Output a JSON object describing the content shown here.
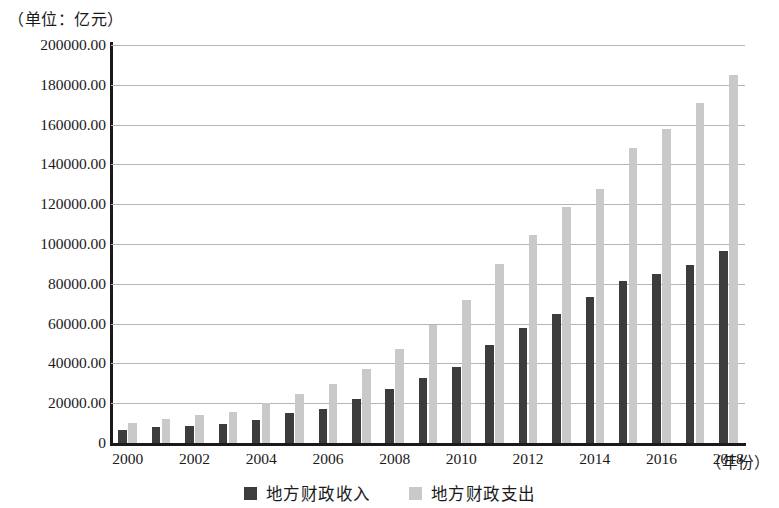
{
  "caption": {
    "unit_label": "（单位：亿元）",
    "x_axis_unit_label": "（年份）"
  },
  "legend": {
    "position": "bottom-center",
    "items": [
      {
        "label": "地方财政收入",
        "color": "#3c3c3c",
        "key": "revenue"
      },
      {
        "label": "地方财政支出",
        "color": "#c9c9c9",
        "key": "expenditure"
      }
    ]
  },
  "axes": {
    "y_ticks": [
      "200000.00",
      "180000.00",
      "160000.00",
      "140000.00",
      "120000.00",
      "100000.00",
      "80000.00",
      "60000.00",
      "40000.00",
      "20000.00",
      "0"
    ],
    "x_ticks": [
      "2000",
      "2002",
      "2004",
      "2006",
      "2008",
      "2010",
      "2012",
      "2014",
      "2016",
      "2018"
    ]
  },
  "chart_data": {
    "type": "bar",
    "title": "",
    "subtitle": "",
    "xlabel": "（年份）",
    "ylabel": "（单位：亿元）",
    "ylim": [
      0,
      200000
    ],
    "ytick_step": 20000,
    "grid": true,
    "legend_position": "bottom-center",
    "categories": [
      "2000",
      "2001",
      "2002",
      "2003",
      "2004",
      "2005",
      "2006",
      "2007",
      "2008",
      "2009",
      "2010",
      "2011",
      "2012",
      "2013",
      "2014",
      "2015",
      "2016",
      "2017",
      "2018"
    ],
    "series": [
      {
        "name": "地方财政收入",
        "color": "#3c3c3c",
        "values": [
          6400,
          7800,
          8500,
          9800,
          11800,
          14900,
          17000,
          22000,
          27000,
          32500,
          38000,
          49500,
          58000,
          65000,
          73500,
          81500,
          85000,
          89500,
          96500
        ]
      },
      {
        "name": "地方财政支出",
        "color": "#c9c9c9",
        "values": [
          10000,
          12000,
          14000,
          15500,
          20000,
          24500,
          29500,
          37000,
          47000,
          59500,
          72000,
          90000,
          104500,
          118500,
          127500,
          148000,
          158000,
          171000,
          185000
        ]
      }
    ]
  }
}
